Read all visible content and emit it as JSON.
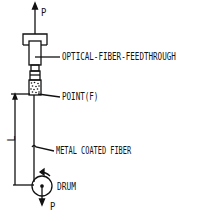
{
  "diagram": {
    "labels": {
      "feedthrough": "OPTICAL-FIBER-FEEDTHROUGH",
      "point": "POINT(F)",
      "fiber": "METAL COATED FIBER",
      "drum": "DRUM",
      "force_top": "P",
      "force_bottom": "P",
      "length": "L"
    },
    "colors": {
      "line": "#111111",
      "background": "#ffffff"
    }
  }
}
